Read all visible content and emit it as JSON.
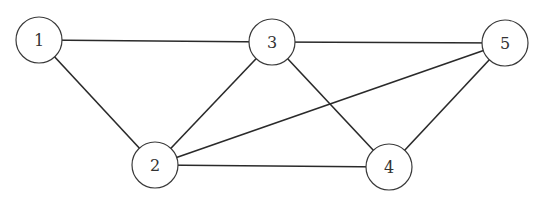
{
  "graph": {
    "nodes": [
      {
        "id": "1",
        "label": "1",
        "x": 39,
        "y": 40,
        "r": 23
      },
      {
        "id": "2",
        "label": "2",
        "x": 155,
        "y": 165,
        "r": 23
      },
      {
        "id": "3",
        "label": "3",
        "x": 272,
        "y": 42,
        "r": 23
      },
      {
        "id": "4",
        "label": "4",
        "x": 389,
        "y": 167,
        "r": 23
      },
      {
        "id": "5",
        "label": "5",
        "x": 505,
        "y": 43,
        "r": 23
      }
    ],
    "edges": [
      {
        "from": "1",
        "to": "3"
      },
      {
        "from": "1",
        "to": "2"
      },
      {
        "from": "3",
        "to": "5"
      },
      {
        "from": "3",
        "to": "2"
      },
      {
        "from": "3",
        "to": "4"
      },
      {
        "from": "5",
        "to": "2"
      },
      {
        "from": "5",
        "to": "4"
      },
      {
        "from": "2",
        "to": "4"
      }
    ]
  }
}
